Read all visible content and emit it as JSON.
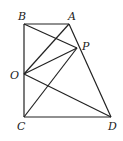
{
  "diagram": {
    "points": {
      "B": {
        "label": "B",
        "x": 24,
        "y": 24
      },
      "A": {
        "label": "A",
        "x": 69,
        "y": 24
      },
      "P": {
        "label": "P",
        "x": 77,
        "y": 48
      },
      "O": {
        "label": "O",
        "x": 24,
        "y": 74
      },
      "C": {
        "label": "C",
        "x": 24,
        "y": 117
      },
      "D": {
        "label": "D",
        "x": 111,
        "y": 117
      }
    },
    "segments": [
      [
        "B",
        "A"
      ],
      [
        "A",
        "D"
      ],
      [
        "D",
        "C"
      ],
      [
        "C",
        "B"
      ],
      [
        "B",
        "P"
      ],
      [
        "O",
        "A"
      ],
      [
        "O",
        "P"
      ],
      [
        "O",
        "D"
      ],
      [
        "C",
        "P"
      ]
    ],
    "labels": {
      "B": "B",
      "A": "A",
      "P": "P",
      "O": "O",
      "C": "C",
      "D": "D"
    }
  }
}
